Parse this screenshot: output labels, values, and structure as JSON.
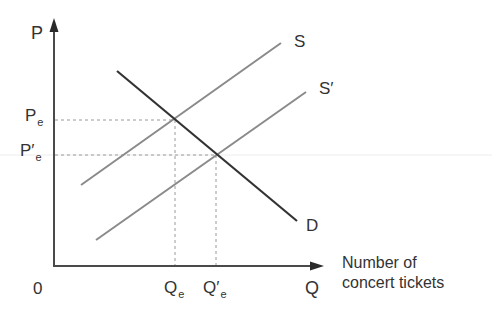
{
  "diagram": {
    "type": "supply-demand",
    "axes": {
      "y_label": "P",
      "x_label": "Q",
      "origin_label": "0",
      "x_title_line1": "Number of",
      "x_title_line2": "concert tickets"
    },
    "curves": [
      {
        "name": "S",
        "label": "S",
        "prime": "",
        "role": "supply",
        "color": "#8a8a8a"
      },
      {
        "name": "S'",
        "label": "S",
        "prime": "′",
        "role": "shifted-supply",
        "color": "#8a8a8a"
      },
      {
        "name": "D",
        "label": "D",
        "prime": "",
        "role": "demand",
        "color": "#333333"
      }
    ],
    "equilibria": [
      {
        "price_label": "P",
        "price_prime": "",
        "price_sub": "e",
        "quantity_label": "Q",
        "quantity_prime": "",
        "quantity_sub": "e"
      },
      {
        "price_label": "P",
        "price_prime": "′",
        "price_sub": "e",
        "quantity_label": "Q",
        "quantity_prime": "′",
        "quantity_sub": "e"
      }
    ]
  },
  "colors": {
    "axis": "#4a4a4a",
    "supply": "#8a8a8a",
    "demand": "#333333",
    "guide": "#9a9a9a",
    "faint_line": "#ededed"
  }
}
